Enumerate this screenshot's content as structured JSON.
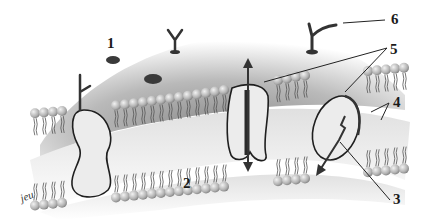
{
  "diagram": {
    "labels": [
      {
        "id": "1",
        "text": "1"
      },
      {
        "id": "2",
        "text": "2"
      },
      {
        "id": "3",
        "text": "3"
      },
      {
        "id": "4",
        "text": "4"
      },
      {
        "id": "5",
        "text": "5"
      },
      {
        "id": "6",
        "text": "6"
      }
    ],
    "signature": "jeu",
    "colors": {
      "background": "#ffffff",
      "surface_dark": "#7a7a7a",
      "surface_light": "#d8d8d8",
      "head": "#b5b5b5",
      "protein_fill": "#e9e9e9",
      "outline": "#1f1f1f"
    }
  }
}
